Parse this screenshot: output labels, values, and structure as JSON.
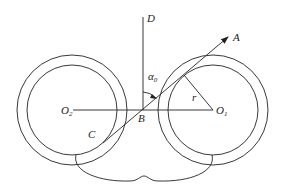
{
  "diagram": {
    "type": "geometric-figure",
    "colors": {
      "line": "#222222",
      "background": "#ffffff"
    },
    "labels": {
      "D": "D",
      "A": "A",
      "B": "B",
      "C": "C",
      "r": "r",
      "alpha": "α",
      "alpha_sub": "0",
      "O_left": "O",
      "O_left_sub": "2",
      "O_right": "O",
      "O_right_sub": "1"
    },
    "elements": [
      {
        "name": "left-circle-pair",
        "center_label": "O2",
        "rings": 2
      },
      {
        "name": "right-circle-pair",
        "center_label": "O1",
        "rings": 2
      },
      {
        "name": "center-line",
        "from": "O2",
        "to": "O1"
      },
      {
        "name": "vertical-line",
        "from": "B",
        "to": "D"
      },
      {
        "name": "tangent-line",
        "from": "C",
        "to": "A",
        "arrow": "A"
      },
      {
        "name": "radius-line",
        "from": "O1",
        "label": "r"
      },
      {
        "name": "angle-mark",
        "label": "α0",
        "between": [
          "BD",
          "BA"
        ]
      },
      {
        "name": "bottom-lobe",
        "description": "curved outline connecting bottoms of both circles"
      }
    ]
  }
}
